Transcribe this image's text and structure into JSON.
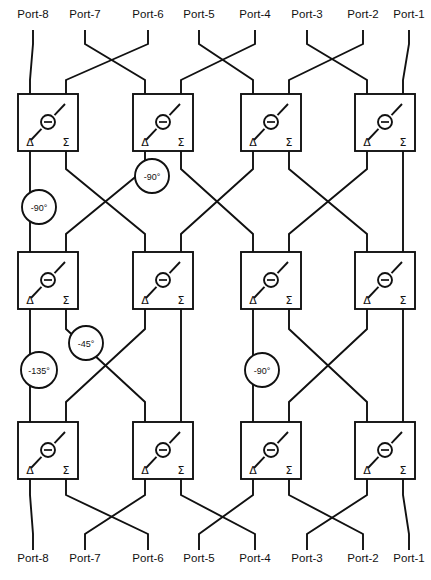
{
  "diagram": {
    "type": "schematic",
    "width": 431,
    "height": 580,
    "background_color": "#ffffff",
    "line_color": "#111111"
  },
  "top_ports": [
    {
      "label": "Port-8",
      "x": 33,
      "y": 18
    },
    {
      "label": "Port-7",
      "x": 85,
      "y": 18
    },
    {
      "label": "Port-6",
      "x": 148,
      "y": 18
    },
    {
      "label": "Port-5",
      "x": 199,
      "y": 18
    },
    {
      "label": "Port-4",
      "x": 255,
      "y": 18
    },
    {
      "label": "Port-3",
      "x": 307,
      "y": 18
    },
    {
      "label": "Port-2",
      "x": 363,
      "y": 18
    },
    {
      "label": "Port-1",
      "x": 409,
      "y": 18
    }
  ],
  "bottom_ports": [
    {
      "label": "Port-8",
      "x": 33,
      "y": 562
    },
    {
      "label": "Port-7",
      "x": 85,
      "y": 562
    },
    {
      "label": "Port-6",
      "x": 148,
      "y": 562
    },
    {
      "label": "Port-5",
      "x": 199,
      "y": 562
    },
    {
      "label": "Port-4",
      "x": 255,
      "y": 562
    },
    {
      "label": "Port-3",
      "x": 307,
      "y": 562
    },
    {
      "label": "Port-2",
      "x": 363,
      "y": 562
    },
    {
      "label": "Port-1",
      "x": 409,
      "y": 562
    }
  ],
  "coupler": {
    "delta_label": "Δ",
    "sigma_label": "Σ",
    "center_symbol": "minus-in-circle",
    "width": 60,
    "height": 57
  },
  "couplers": [
    {
      "id": "c1-1",
      "row": 1,
      "col": 1,
      "x": 18,
      "y": 94
    },
    {
      "id": "c1-2",
      "row": 1,
      "col": 2,
      "x": 133,
      "y": 94
    },
    {
      "id": "c1-3",
      "row": 1,
      "col": 3,
      "x": 241,
      "y": 94
    },
    {
      "id": "c1-4",
      "row": 1,
      "col": 4,
      "x": 355,
      "y": 94
    },
    {
      "id": "c2-1",
      "row": 2,
      "col": 1,
      "x": 18,
      "y": 252
    },
    {
      "id": "c2-2",
      "row": 2,
      "col": 2,
      "x": 133,
      "y": 252
    },
    {
      "id": "c2-3",
      "row": 2,
      "col": 3,
      "x": 241,
      "y": 252
    },
    {
      "id": "c2-4",
      "row": 2,
      "col": 4,
      "x": 355,
      "y": 252
    },
    {
      "id": "c3-1",
      "row": 3,
      "col": 1,
      "x": 18,
      "y": 422
    },
    {
      "id": "c3-2",
      "row": 3,
      "col": 2,
      "x": 133,
      "y": 422
    },
    {
      "id": "c3-3",
      "row": 3,
      "col": 3,
      "x": 241,
      "y": 422
    },
    {
      "id": "c3-4",
      "row": 3,
      "col": 4,
      "x": 355,
      "y": 422
    }
  ],
  "phase_shifters": [
    {
      "id": "ps1",
      "label": "-90°",
      "cx": 39,
      "cy": 207,
      "r": 17
    },
    {
      "id": "ps2",
      "label": "-90°",
      "cx": 152,
      "cy": 176,
      "r": 17
    },
    {
      "id": "ps3",
      "label": "-135°",
      "cx": 39,
      "cy": 370,
      "r": 18
    },
    {
      "id": "ps4",
      "label": "-45°",
      "cx": 86,
      "cy": 343,
      "r": 17
    },
    {
      "id": "ps5",
      "label": "-90°",
      "cx": 262,
      "cy": 370,
      "r": 17
    }
  ],
  "geometry": {
    "delta_offset": 12,
    "sigma_offset": 48,
    "stub_len": 14
  }
}
